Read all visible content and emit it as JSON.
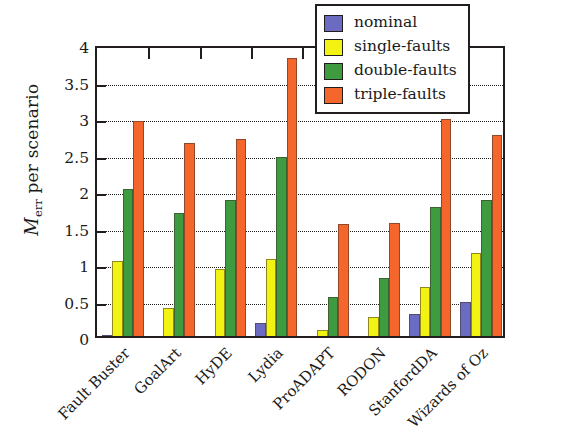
{
  "chart_data": {
    "type": "bar",
    "title": "",
    "xlabel": "",
    "ylabel": "M_err per scenario",
    "ylabel_main": "M",
    "ylabel_sub": "err",
    "ylabel_tail": " per scenario",
    "ylim": [
      0,
      4
    ],
    "ytick_values": [
      0,
      0.5,
      1,
      1.5,
      2,
      2.5,
      3,
      3.5,
      4
    ],
    "ytick_labels": [
      "0",
      "0.5",
      "1",
      "1.5",
      "2",
      "2.5",
      "3",
      "3.5",
      "4"
    ],
    "grid": "horizontal-dotted",
    "legend_position": "top-right-inside",
    "categories": [
      "Fault Buster",
      "GoalArt",
      "HyDE",
      "Lydia",
      "ProADAPT",
      "RODON",
      "StanfordDA",
      "Wizards of Oz"
    ],
    "series": [
      {
        "name": "nominal",
        "color": "#6b6bc4",
        "values": [
          0.02,
          0.0,
          0.0,
          0.18,
          0.0,
          0.0,
          0.3,
          0.47
        ]
      },
      {
        "name": "single-faults",
        "color": "#f2f213",
        "values": [
          1.03,
          0.38,
          0.92,
          1.05,
          0.08,
          0.26,
          0.67,
          1.14
        ]
      },
      {
        "name": "double-faults",
        "color": "#3f9b3f",
        "values": [
          2.02,
          1.69,
          1.86,
          2.45,
          0.54,
          0.8,
          1.77,
          1.87
        ]
      },
      {
        "name": "triple-faults",
        "color": "#f4662c",
        "values": [
          2.95,
          2.64,
          2.7,
          3.81,
          1.54,
          1.55,
          2.97,
          2.75
        ]
      }
    ]
  },
  "legend": {
    "items": [
      {
        "label": "nominal",
        "color": "#6b6bc4"
      },
      {
        "label": "single-faults",
        "color": "#f2f213"
      },
      {
        "label": "double-faults",
        "color": "#3f9b3f"
      },
      {
        "label": "triple-faults",
        "color": "#f4662c"
      }
    ]
  }
}
